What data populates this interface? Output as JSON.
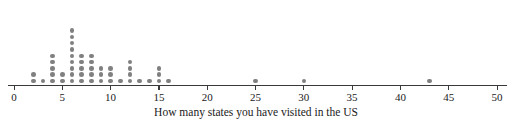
{
  "chart_data": {
    "type": "dotplot",
    "title": "",
    "xlabel": "How many states you have visited in the US",
    "ylabel": "",
    "xlim": [
      0,
      51
    ],
    "grid": false,
    "legend": null,
    "xticks": [
      0,
      5,
      10,
      15,
      20,
      25,
      30,
      35,
      40,
      45,
      50
    ],
    "xtick_labels": [
      "0",
      "5",
      "10",
      "15",
      "20",
      "25",
      "30",
      "35",
      "40",
      "45",
      "50"
    ],
    "dot_color": "#808080",
    "axis_color": "#3a3a3a",
    "categories": [
      2,
      3,
      4,
      5,
      6,
      7,
      8,
      9,
      10,
      11,
      12,
      13,
      14,
      15,
      16,
      25,
      30,
      43
    ],
    "values": [
      2,
      1,
      5,
      2,
      9,
      5,
      5,
      3,
      3,
      1,
      4,
      1,
      1,
      3,
      1,
      1,
      1,
      1
    ],
    "total_count": 49,
    "max_stack": 9,
    "annotations": []
  },
  "axis": {
    "title": "How many states you have visited in the US"
  }
}
